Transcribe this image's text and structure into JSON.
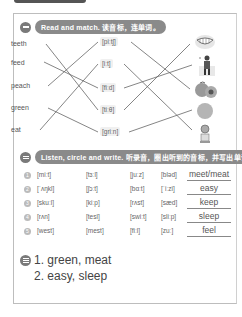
{
  "section1": {
    "number": "1",
    "title": "Read and match. 读音标，连单词。",
    "words": [
      "teeth",
      "feed",
      "peach",
      "green",
      "eat"
    ],
    "phonetics": [
      "[piːtʃ]",
      "[iːt]",
      "[fiːd]",
      "[tiːθ]",
      "[ɡriːn]"
    ],
    "pictures": [
      "grinning-teeth-picture",
      "person-feeding-picture",
      "peaches-picture",
      "green-ball-picture",
      "child-eating-picture"
    ],
    "word_to_phonetic": [
      [
        0,
        3
      ],
      [
        1,
        2
      ],
      [
        2,
        0
      ],
      [
        3,
        4
      ],
      [
        4,
        1
      ]
    ],
    "phonetic_to_picture": [
      [
        0,
        2
      ],
      [
        1,
        4
      ],
      [
        2,
        1
      ],
      [
        3,
        0
      ],
      [
        4,
        3
      ]
    ]
  },
  "section2": {
    "number": "2",
    "title": "Listen, circle and write. 听录音，圈出听到的音标，并写出单词。",
    "rows": [
      {
        "idx": "1",
        "c1": "[miːt]",
        "c2": "[tɜːl]",
        "c3": "[juːz]",
        "c4": "[bləd]",
        "answer": "meet/meat"
      },
      {
        "idx": "2",
        "c1": "[ˈʌŋkl]",
        "c2": "[ʃɔːt]",
        "c3": "[bɑːt]",
        "c4": "[ˈiːzi]",
        "answer": "easy"
      },
      {
        "idx": "3",
        "c1": "[skuːl]",
        "c2": "[kiːp]",
        "c3": "[rʌst]",
        "c4": "[sæd]",
        "answer": "keep"
      },
      {
        "idx": "4",
        "c1": "[rʌn]",
        "c2": "[tesl]",
        "c3": "[swiːt]",
        "c4": "[sliːp]",
        "answer": "sleep"
      },
      {
        "idx": "5",
        "c1": "[west]",
        "c2": "[mest]",
        "c3": "[fiːl]",
        "c4": "[zuː]",
        "answer": "feel"
      }
    ]
  },
  "section3": {
    "number": "3",
    "lines": [
      "1. green, meat",
      "2. easy, sleep"
    ]
  }
}
